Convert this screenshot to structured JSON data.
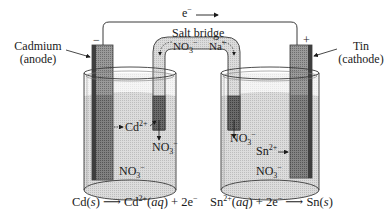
{
  "diagram": {
    "type": "galvanic-cell",
    "electron_flow": {
      "label": "e",
      "charge": "−",
      "direction": "left-to-right"
    },
    "anode": {
      "name": "Cadmium",
      "role": "(anode)",
      "terminal_sign": "−",
      "ion": "Cd",
      "ion_charge": "2+",
      "half_reaction": {
        "left_species": "Cd",
        "left_state": "s",
        "right_species": "Cd",
        "right_charge": "2+",
        "right_state": "aq",
        "electrons": "2e",
        "electron_charge": "−"
      }
    },
    "cathode": {
      "name": "Tin",
      "role": "(cathode)",
      "terminal_sign": "+",
      "ion": "Sn",
      "ion_charge": "2+",
      "half_reaction": {
        "left_species": "Sn",
        "left_charge": "2+",
        "left_state": "aq",
        "electrons": "2e",
        "electron_charge": "−",
        "right_species": "Sn",
        "right_state": "s"
      }
    },
    "salt_bridge": {
      "label": "Salt bridge",
      "anion": "NO",
      "anion_sub": "3",
      "anion_charge": "−",
      "cation": "Na",
      "cation_charge": "+"
    },
    "solution_anion": {
      "formula": "NO",
      "sub": "3",
      "charge": "−"
    },
    "plus": "+",
    "colors": {
      "line": "#3a3a3a",
      "electrode": "#8c8c8c",
      "electrode_dark": "#5e5e5e",
      "solution": "#cfcfcf",
      "glass": "#e8e8e8",
      "bridge": "#d4d4d4",
      "bridge_plug": "#4a4a4a"
    }
  }
}
